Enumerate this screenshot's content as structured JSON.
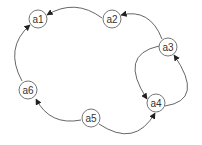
{
  "diagram": {
    "type": "directed-graph",
    "colors": {
      "edge": "#555555",
      "node_stroke": "#666666",
      "node_fill": "#ffffff",
      "arrow": "#222222",
      "label": "#333333"
    },
    "nodes": [
      {
        "id": "a1",
        "label": "a1",
        "x": 38,
        "y": 19
      },
      {
        "id": "a2",
        "label": "a2",
        "x": 112,
        "y": 19
      },
      {
        "id": "a3",
        "label": "a3",
        "x": 168,
        "y": 47
      },
      {
        "id": "a4",
        "label": "a4",
        "x": 156,
        "y": 103
      },
      {
        "id": "a5",
        "label": "a5",
        "x": 91,
        "y": 118
      },
      {
        "id": "a6",
        "label": "a6",
        "x": 28,
        "y": 90
      }
    ],
    "edges": [
      {
        "from": "a2",
        "to": "a1"
      },
      {
        "from": "a3",
        "to": "a2"
      },
      {
        "from": "a6",
        "to": "a1"
      },
      {
        "from": "a5",
        "to": "a6"
      },
      {
        "from": "a5",
        "to": "a4"
      },
      {
        "from": "a3",
        "to": "a4"
      },
      {
        "from": "a4",
        "to": "a3"
      }
    ]
  }
}
